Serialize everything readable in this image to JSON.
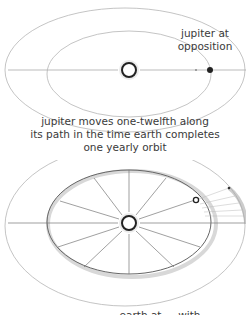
{
  "top_panel": {
    "label_opposition": [
      "jupiter at",
      "opposition"
    ],
    "caption": [
      "jupiter moves one-twelfth along",
      "its path in the time earth completes",
      "one yearly orbit"
    ]
  },
  "bottom_panel": {
    "caption_partial": "earth at ... with"
  },
  "bodies": {
    "sun": "sun",
    "earth": "earth",
    "jupiter": "jupiter"
  },
  "colors": {
    "orbit_line": "#aaaaaa",
    "text": "#3a3a3a",
    "sun_ring": "#222222"
  }
}
